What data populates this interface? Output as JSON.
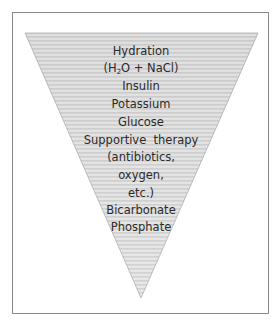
{
  "diagram": {
    "type": "inverted-triangle",
    "colors": {
      "frame_border": "#8a8a8a",
      "triangle_stripe_dark": "#d6d6d6",
      "triangle_stripe_light": "#e8e8e8",
      "triangle_outline": "#b0b0b0",
      "text": "#2a2a2a"
    },
    "items": [
      {
        "label": "Hydration"
      },
      {
        "label_prefix": "(H",
        "label_sub": "2",
        "label_suffix": "O + NaCl)"
      },
      {
        "label": "Insulin"
      },
      {
        "label": "Potassium"
      },
      {
        "label": "Glucose"
      },
      {
        "label": "Supportive  therapy"
      },
      {
        "label": "(antibiotics,"
      },
      {
        "label": "oxygen,"
      },
      {
        "label": "etc.)"
      },
      {
        "label": "Bicarbonate"
      },
      {
        "label": "Phosphate"
      }
    ]
  }
}
